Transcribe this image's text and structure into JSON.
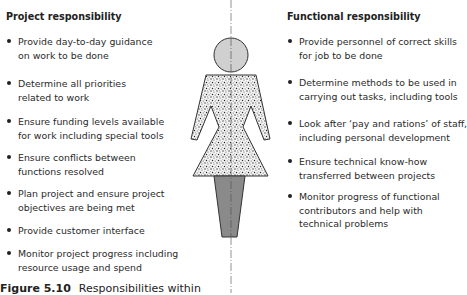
{
  "left": {
    "heading": "Project responsibility",
    "items": [
      "Provide day-to-day guidance\non work to be done",
      "Determine all priorities\nrelated to work",
      "Ensure funding levels available\nfor work including special tools",
      "Ensure conflicts between\nfunctions resolved",
      "Plan project and ensure project\nobjectives are being met",
      "Provide customer interface",
      "Monitor project progress including\nresource usage and spend"
    ]
  },
  "right": {
    "heading": "Functional responsibility",
    "items": [
      "Provide personnel of correct skills\nfor job to be done",
      "Determine methods to be used in\ncarrying out tasks, including tools",
      "Look after ‘pay and rations’ of staff,\nincluding personal development",
      "Ensure technical know-how\ntransferred between projects",
      "Monitor progress of functional\ncontributors and help with\ntechnical problems"
    ]
  },
  "figure": {
    "icon": "person-figure-icon",
    "head_color": "#d0d0d0",
    "body_pattern": "speckled",
    "legs_color": "#8a8a8a",
    "centerline": "dash-dot"
  },
  "caption": {
    "label": "Figure 5.10",
    "text": "Responsibilities within"
  }
}
